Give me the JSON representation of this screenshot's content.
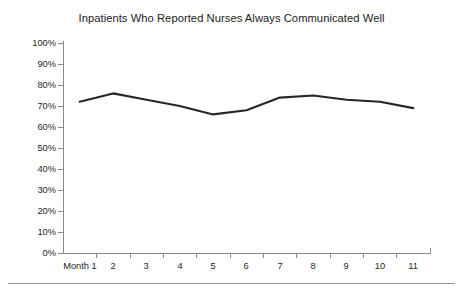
{
  "chart_data": {
    "type": "line",
    "title": "Inpatients Who Reported Nurses Always Communicated Well",
    "xlabel": "",
    "ylabel": "",
    "categories": [
      "Month 1",
      "2",
      "3",
      "4",
      "5",
      "6",
      "7",
      "8",
      "9",
      "10",
      "11"
    ],
    "x_tick_labels": [
      "Month 1",
      "2",
      "3",
      "4",
      "5",
      "6",
      "7",
      "8",
      "9",
      "10",
      "11"
    ],
    "values": [
      72,
      76,
      73,
      70,
      66,
      68,
      74,
      75,
      73,
      72,
      69
    ],
    "series": [
      {
        "name": "Inpatients Who Reported Nurses Always Communicated Well",
        "values": [
          72,
          76,
          73,
          70,
          66,
          68,
          74,
          75,
          73,
          72,
          69
        ]
      }
    ],
    "y_tick_labels": [
      "100%",
      "90%",
      "80%",
      "70%",
      "60%",
      "50%",
      "40%",
      "30%",
      "20%",
      "10%",
      "0%"
    ],
    "y_tick_values": [
      100,
      90,
      80,
      70,
      60,
      50,
      40,
      30,
      20,
      10,
      0
    ],
    "ylim": [
      0,
      100
    ],
    "y_unit": "%",
    "grid": false,
    "legend": false,
    "legend_position": "none",
    "line_color": "#262626",
    "axis_color": "#8a8a8a",
    "background_color": "#ffffff",
    "markers": false
  }
}
